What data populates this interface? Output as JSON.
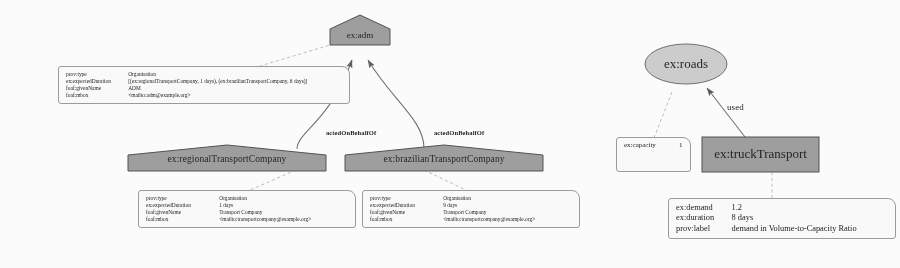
{
  "diagram": {
    "colors": {
      "agent_fill": "#9e9e9e",
      "entity_fill": "#cfcfcf",
      "activity_fill": "#9e9e9e",
      "annotation_fill": "#fdfdfd",
      "edge": "#6f6f6f",
      "text": "#141414"
    },
    "nodes": {
      "top_agent": {
        "label": "ex:adm",
        "shape": "house"
      },
      "agent_regional": {
        "label": "ex:regionalTransportCompany",
        "shape": "house"
      },
      "agent_brazilian": {
        "label": "ex:brazilianTransportCompany",
        "shape": "house"
      },
      "entity_roads": {
        "label": "ex:roads",
        "shape": "ellipse"
      },
      "activity_truck": {
        "label": "ex:truckTransport",
        "shape": "rectangle"
      }
    },
    "edges": {
      "acted_left": "actedOnBehalfOf",
      "acted_right": "actedOnBehalfOf",
      "used": "used"
    },
    "annotations": {
      "adm": {
        "rows": [
          {
            "key": "prov:type",
            "value": "Organisation"
          },
          {
            "key": "ex:expectedDuration",
            "value": "[(ex:regionalTransportCompany, 1 days), (ex:brazilianTransportCompany, 6 days)]"
          },
          {
            "key": "foaf:givenName",
            "value": "ADM"
          },
          {
            "key": "foaf:mbox",
            "value": "<mailto:adm@example.org>"
          }
        ]
      },
      "regional": {
        "rows": [
          {
            "key": "prov:type",
            "value": "Organisation"
          },
          {
            "key": "ex:expectedDuration",
            "value": "1 days"
          },
          {
            "key": "foaf:givenName",
            "value": "Transport Company"
          },
          {
            "key": "foaf:mbox",
            "value": "<mailto:transportcompany@example.org>"
          }
        ]
      },
      "brazilian": {
        "rows": [
          {
            "key": "prov:type",
            "value": "Organisation"
          },
          {
            "key": "ex:expectedDuration",
            "value": "9 days"
          },
          {
            "key": "foaf:givenName",
            "value": "Transport Company"
          },
          {
            "key": "foaf:mbox",
            "value": "<mailto:transportcompany@example.org>"
          }
        ]
      },
      "roads": {
        "rows": [
          {
            "key": "ex:capacity",
            "value": "1"
          }
        ]
      },
      "truck": {
        "rows": [
          {
            "key": "ex:demand",
            "value": "1.2"
          },
          {
            "key": "ex:duration",
            "value": "8 days"
          },
          {
            "key": "prov:label",
            "value": "demand in Volume-to-Capacity Ratio"
          }
        ]
      }
    }
  }
}
